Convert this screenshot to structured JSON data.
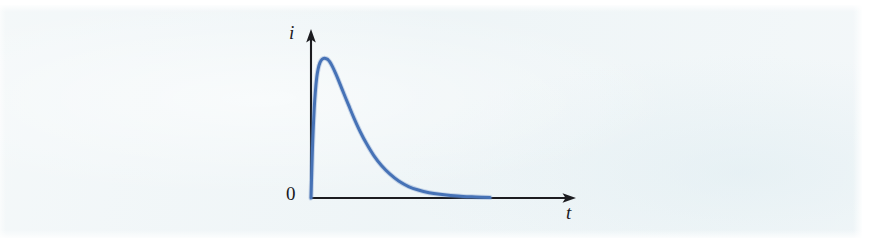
{
  "figure": {
    "caption_visible": false,
    "background_color": "#eff5f7",
    "page_color": "#ffffff"
  },
  "axes": {
    "y_axis_label": "i",
    "x_axis_label": "t",
    "origin_label": "0",
    "axis_color": "#1c1c20",
    "origin_px": {
      "x": 311,
      "y": 198
    },
    "y_axis_tip_px": {
      "x": 311,
      "y": 31
    },
    "x_axis_tip_px": {
      "x": 575,
      "y": 198
    },
    "y_axis_arrow": true,
    "x_axis_arrow": true
  },
  "chart_data": {
    "type": "line",
    "title": "",
    "subtitle": "",
    "xlabel": "t",
    "ylabel": "i",
    "grid": false,
    "legend": null,
    "annotations": [
      {
        "text": "0",
        "role": "origin-label",
        "x": 0,
        "y": 0
      }
    ],
    "axis_tick_labels": {
      "x": [],
      "y": [
        "0"
      ]
    },
    "xlim": [
      0,
      1
    ],
    "ylim": [
      0,
      1.08
    ],
    "curve_color": "#4672b6",
    "series": [
      {
        "name": "i(t)",
        "color": "#4672b6",
        "x": [
          0.0,
          0.004,
          0.008,
          0.012,
          0.018,
          0.024,
          0.032,
          0.04,
          0.05,
          0.062,
          0.075,
          0.09,
          0.094,
          0.105,
          0.12,
          0.14,
          0.16,
          0.185,
          0.21,
          0.24,
          0.275,
          0.31,
          0.35,
          0.395,
          0.44,
          0.49,
          0.545,
          0.6,
          0.66,
          0.72,
          0.78,
          0.85,
          0.92,
          1.0
        ],
        "y": [
          0.0,
          0.18,
          0.345,
          0.48,
          0.64,
          0.755,
          0.862,
          0.924,
          0.968,
          0.992,
          1.0,
          0.994,
          0.99,
          0.974,
          0.94,
          0.884,
          0.822,
          0.742,
          0.664,
          0.572,
          0.474,
          0.389,
          0.305,
          0.23,
          0.172,
          0.121,
          0.082,
          0.057,
          0.038,
          0.026,
          0.018,
          0.011,
          0.007,
          0.003
        ]
      }
    ]
  }
}
